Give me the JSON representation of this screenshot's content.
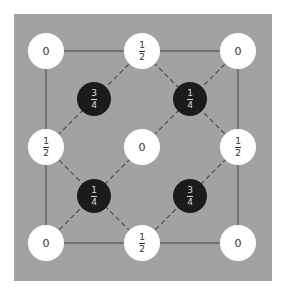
{
  "diagram": {
    "colors": {
      "background": "#a2a2a2",
      "white_node": "#ffffff",
      "dark_node": "#1b1b1b",
      "line": "#505050"
    },
    "white_nodes": [
      {
        "x": 46,
        "y": 51,
        "label": "0"
      },
      {
        "x": 142,
        "y": 51,
        "num": "1",
        "den": "2"
      },
      {
        "x": 238,
        "y": 51,
        "label": "0"
      },
      {
        "x": 46,
        "y": 147,
        "num": "1",
        "den": "2"
      },
      {
        "x": 142,
        "y": 147,
        "label": "0"
      },
      {
        "x": 238,
        "y": 147,
        "num": "1",
        "den": "2"
      },
      {
        "x": 46,
        "y": 243,
        "label": "0"
      },
      {
        "x": 142,
        "y": 243,
        "num": "1",
        "den": "2"
      },
      {
        "x": 238,
        "y": 243,
        "label": "0"
      }
    ],
    "dark_nodes": [
      {
        "x": 94,
        "y": 99,
        "num": "3",
        "den": "4"
      },
      {
        "x": 190,
        "y": 99,
        "num": "1",
        "den": "4"
      },
      {
        "x": 94,
        "y": 196,
        "num": "1",
        "den": "4"
      },
      {
        "x": 190,
        "y": 196,
        "num": "3",
        "den": "4"
      }
    ]
  }
}
